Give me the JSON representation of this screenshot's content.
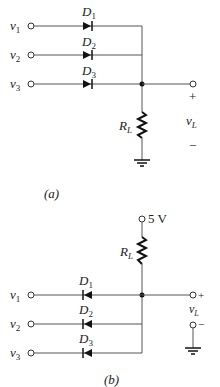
{
  "circuit_a": {
    "caption": "(a)",
    "inputs": [
      {
        "label": "v",
        "sub": "1",
        "diode": "D",
        "diode_sub": "1"
      },
      {
        "label": "v",
        "sub": "2",
        "diode": "D",
        "diode_sub": "2"
      },
      {
        "label": "v",
        "sub": "3",
        "diode": "D",
        "diode_sub": "3"
      }
    ],
    "resistor": {
      "label": "R",
      "sub": "L"
    },
    "output": {
      "plus": "+",
      "minus": "−",
      "label": "v",
      "sub": "L"
    },
    "diode_direction": "forward (anode at input, cathode at bus)"
  },
  "circuit_b": {
    "caption": "(b)",
    "supply": "5 V",
    "inputs": [
      {
        "label": "v",
        "sub": "1",
        "diode": "D",
        "diode_sub": "1"
      },
      {
        "label": "v",
        "sub": "2",
        "diode": "D",
        "diode_sub": "2"
      },
      {
        "label": "v",
        "sub": "3",
        "diode": "D",
        "diode_sub": "3"
      }
    ],
    "resistor": {
      "label": "R",
      "sub": "L"
    },
    "output": {
      "plus": "+",
      "minus": "−",
      "label": "v",
      "sub": "L"
    },
    "diode_direction": "reverse (cathode at input, anode at bus)"
  },
  "colors": {
    "wire": "#555555",
    "ink": "#222222",
    "background": "#ffffff"
  }
}
